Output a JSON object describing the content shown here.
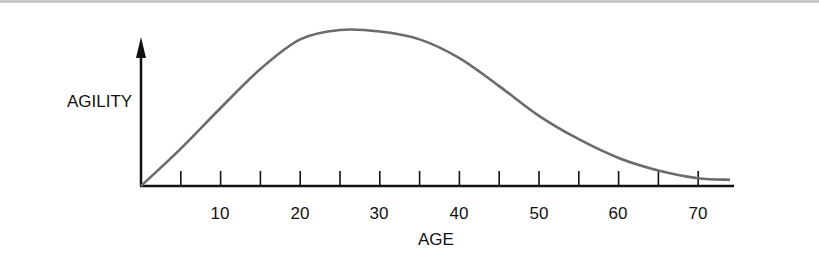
{
  "chart_data": {
    "type": "line",
    "title": "",
    "xlabel": "AGE",
    "ylabel": "AGILITY",
    "x_tick_labels": [
      "10",
      "20",
      "30",
      "40",
      "50",
      "60",
      "70"
    ],
    "x_ticks_minor_every": 5,
    "xlim": [
      0,
      74
    ],
    "ylim": [
      0,
      100
    ],
    "y_ticks": [],
    "grid": false,
    "legend": null,
    "series": [
      {
        "name": "Agility",
        "color": "#6b6b6b",
        "x": [
          0,
          5,
          10,
          15,
          20,
          25,
          30,
          35,
          40,
          45,
          50,
          55,
          60,
          65,
          70,
          74
        ],
        "values": [
          0,
          24,
          50,
          75,
          94,
          100,
          99,
          94,
          82,
          64,
          45,
          30,
          18,
          10,
          5,
          4
        ]
      }
    ]
  },
  "axis": {
    "tick_labels": [
      {
        "text": "10",
        "x": 220
      },
      {
        "text": "20",
        "x": 300
      },
      {
        "text": "30",
        "x": 379
      },
      {
        "text": "40",
        "x": 459
      },
      {
        "text": "50",
        "x": 539
      },
      {
        "text": "60",
        "x": 618
      },
      {
        "text": "70",
        "x": 698
      }
    ]
  },
  "colors": {
    "axis": "#111111",
    "curve": "#6b6b6b",
    "top_border": "#c8c8c8"
  }
}
